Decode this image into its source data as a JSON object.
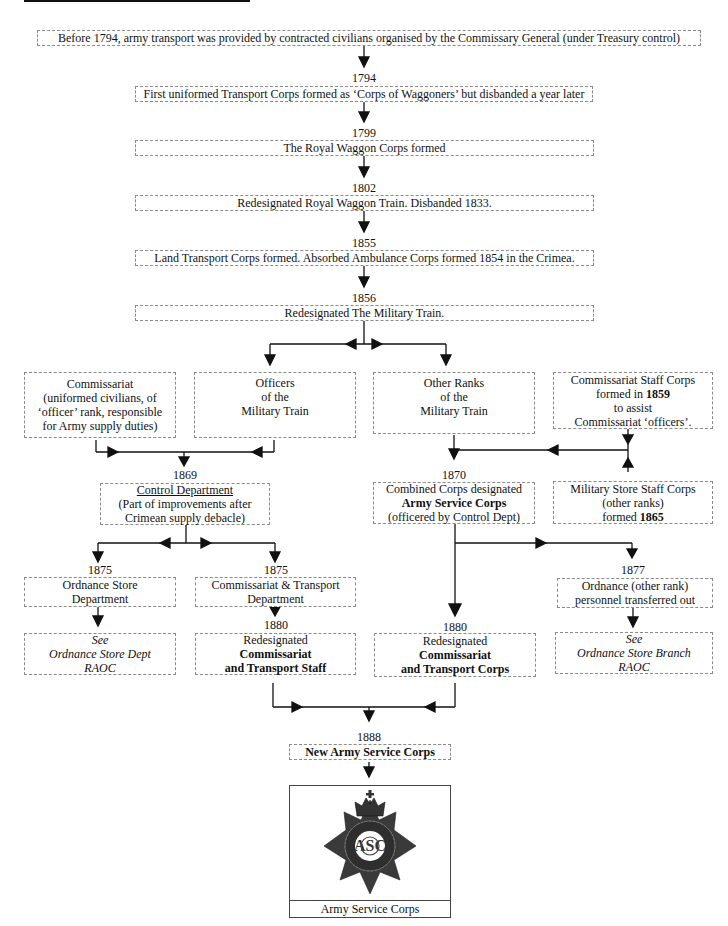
{
  "nodes": {
    "pre1794": {
      "text": "Before 1794, army transport was provided by contracted civilians organised by the Commissary General (under Treasury control)"
    },
    "n1794": {
      "year": "1794",
      "text": "First uniformed Transport Corps formed as ‘Corps of Waggoners’ but disbanded a year later"
    },
    "n1799": {
      "year": "1799",
      "text": "The Royal Waggon Corps formed"
    },
    "n1802": {
      "year": "1802",
      "text": "Redesignated Royal Waggon Train.  Disbanded 1833."
    },
    "n1855": {
      "year": "1855",
      "text": "Land Transport Corps formed.  Absorbed Ambulance Corps formed 1854 in the Crimea."
    },
    "n1856": {
      "year": "1856",
      "text": "Redesignated The Military Train."
    },
    "commissariat": {
      "lines": [
        "Commissariat",
        "(uniformed civilians, of",
        "‘officer’ rank, responsible",
        "for Army supply duties)"
      ]
    },
    "officers": {
      "lines": [
        "Officers",
        "of the",
        "Military Train"
      ]
    },
    "other_ranks": {
      "lines": [
        "Other Ranks",
        "of the",
        "Military Train"
      ]
    },
    "comm_staff_corps": {
      "line1": "Commissariat Staff Corps",
      "line2_pre": "formed in ",
      "line2_bold": "1859",
      "line3": "to assist",
      "line4": "Commissariat ‘officers’."
    },
    "n1869": {
      "year": "1869",
      "title": "Control Department",
      "lines": [
        "(Part of improvements after",
        "Crimean supply debacle)"
      ]
    },
    "n1870": {
      "year": "1870",
      "line1": "Combined Corps designated",
      "line2_bold": "Army Service Corps",
      "line3": "(officered by Control Dept)"
    },
    "mil_store_staff": {
      "line1": "Military Store Staff Corps",
      "line2": "(other ranks)",
      "line3_pre": "formed ",
      "line3_bold": "1865"
    },
    "n1875a": {
      "year": "1875",
      "lines": [
        "Ordnance Store",
        "Department"
      ]
    },
    "n1875b": {
      "year": "1875",
      "lines": [
        "Commissariat & Transport",
        "Department"
      ]
    },
    "n1877": {
      "year": "1877",
      "lines": [
        "Ordnance (other rank)",
        "personnel transferred out"
      ]
    },
    "see_osd": {
      "lines": [
        "See",
        "Ordnance Store Dept",
        "RAOC"
      ]
    },
    "n1880a": {
      "year": "1880",
      "line1": "Redesignated",
      "line2_bold": "Commissariat",
      "line3_bold": "and Transport Staff"
    },
    "n1880b": {
      "year": "1880",
      "line1": "Redesignated",
      "line2_bold": "Commissariat",
      "line3_bold": "and Transport Corps"
    },
    "see_osb": {
      "lines": [
        "See",
        "Ordnance Store Branch",
        "RAOC"
      ]
    },
    "n1888": {
      "year": "1888",
      "text_bold": "New Army Service Corps"
    },
    "badge": {
      "icon": "army-service-corps-badge-icon",
      "caption": "Army Service Corps"
    }
  },
  "colors": {
    "ink": "#111111",
    "box_border": "#8a8a8a",
    "badge_dark": "#3a3a3a"
  }
}
